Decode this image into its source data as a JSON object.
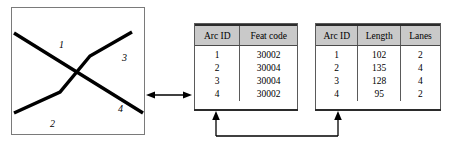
{
  "figure": {
    "map": {
      "name": "arc-network-map",
      "arc_labels": [
        "1",
        "2",
        "3",
        "4"
      ]
    },
    "relation_arrow": {
      "icon": "double-headed-horizontal-arrow",
      "meaning": "map-to-attribute-table link"
    },
    "join_arrow": {
      "icon": "u-shaped-join-arrow",
      "meaning": "join on Arc ID"
    },
    "tables": [
      {
        "id": "arc-feat",
        "columns": [
          "Arc ID",
          "Feat code"
        ],
        "rows": [
          [
            "1",
            "30002"
          ],
          [
            "2",
            "30004"
          ],
          [
            "3",
            "30004"
          ],
          [
            "4",
            "30002"
          ]
        ]
      },
      {
        "id": "arc-length",
        "columns": [
          "Arc ID",
          "Length",
          "Lanes"
        ],
        "rows": [
          [
            "1",
            "102",
            "2"
          ],
          [
            "2",
            "135",
            "4"
          ],
          [
            "3",
            "128",
            "4"
          ],
          [
            "4",
            "95",
            "2"
          ]
        ]
      }
    ],
    "colors": {
      "header_fill": "#c9c9c9",
      "line": "#000000",
      "border": "#5a5a5a",
      "background": "#ffffff"
    }
  }
}
